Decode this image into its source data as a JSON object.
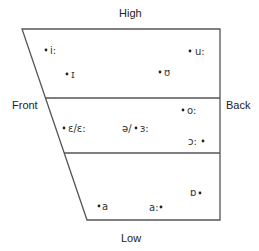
{
  "diagram": {
    "type": "vowel-quadrilateral",
    "labels": {
      "top": "High",
      "bottom": "Low",
      "left": "Front",
      "right": "Back"
    },
    "regions": [
      "high",
      "mid",
      "low"
    ],
    "vowels": [
      {
        "id": "i-long",
        "symbol": "i:",
        "region": "high",
        "dot_side": "left"
      },
      {
        "id": "u-long",
        "symbol": "u:",
        "region": "high",
        "dot_side": "left"
      },
      {
        "id": "i-short",
        "symbol": "ɪ",
        "region": "high",
        "dot_side": "left"
      },
      {
        "id": "u-short",
        "symbol": "ʊ",
        "region": "high",
        "dot_side": "left"
      },
      {
        "id": "o-long",
        "symbol": "o:",
        "region": "mid",
        "dot_side": "left"
      },
      {
        "id": "e-open",
        "symbol": "ɛ/ɛ:",
        "region": "mid",
        "dot_side": "left"
      },
      {
        "id": "schwa",
        "symbol": "ə/",
        "region": "mid",
        "dot_side": "none"
      },
      {
        "id": "er-long",
        "symbol": "ɜ:",
        "region": "mid",
        "dot_side": "left"
      },
      {
        "id": "open-o-long",
        "symbol": "ɔ:",
        "region": "mid",
        "dot_side": "right"
      },
      {
        "id": "o-open-back",
        "symbol": "ɒ",
        "region": "low",
        "dot_side": "right"
      },
      {
        "id": "a-short",
        "symbol": "a",
        "region": "low",
        "dot_side": "left"
      },
      {
        "id": "a-long",
        "symbol": "a:",
        "region": "low",
        "dot_side": "right"
      }
    ]
  }
}
